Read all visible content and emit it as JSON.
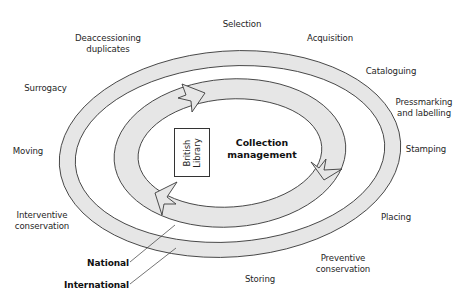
{
  "diagram": {
    "center": {
      "title_line1": "Collection",
      "title_line2": "management",
      "box_line1": "British",
      "box_line2": "Library"
    },
    "rings": [
      {
        "name": "National",
        "level": "inner"
      },
      {
        "name": "International",
        "level": "outer"
      }
    ],
    "ring_labels": {
      "national": "National",
      "international": "International"
    },
    "activities": [
      {
        "id": "selection",
        "line1": "Selection",
        "line2": ""
      },
      {
        "id": "acquisition",
        "line1": "Acquisition",
        "line2": ""
      },
      {
        "id": "cataloguing",
        "line1": "Cataloguing",
        "line2": ""
      },
      {
        "id": "pressmarking",
        "line1": "Pressmarking",
        "line2": "and labelling"
      },
      {
        "id": "stamping",
        "line1": "Stamping",
        "line2": ""
      },
      {
        "id": "placing",
        "line1": "Placing",
        "line2": ""
      },
      {
        "id": "preventive",
        "line1": "Preventive",
        "line2": "conservation"
      },
      {
        "id": "storing",
        "line1": "Storing",
        "line2": ""
      },
      {
        "id": "interventive",
        "line1": "Interventive",
        "line2": "conservation"
      },
      {
        "id": "moving",
        "line1": "Moving",
        "line2": ""
      },
      {
        "id": "surrogacy",
        "line1": "Surrogacy",
        "line2": ""
      },
      {
        "id": "deaccessioning",
        "line1": "Deaccessioning",
        "line2": "duplicates"
      }
    ],
    "colors": {
      "ring_fill": "#e6e6e6",
      "outline": "#3a3a3a",
      "background": "#ffffff"
    }
  }
}
